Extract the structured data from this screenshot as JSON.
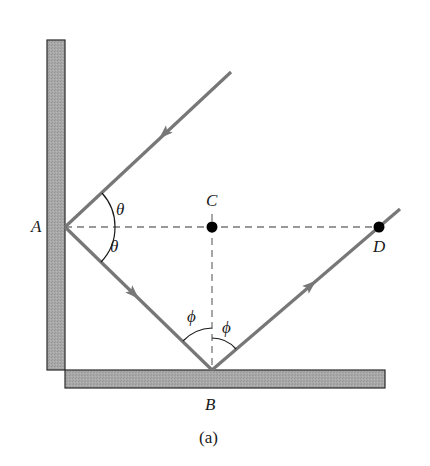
{
  "figure": {
    "caption": "(a)",
    "points": {
      "A": {
        "label": "A"
      },
      "B": {
        "label": "B"
      },
      "C": {
        "label": "C"
      },
      "D": {
        "label": "D"
      }
    },
    "angles": {
      "theta_upper": "θ",
      "theta_lower": "θ",
      "phi_left": "ϕ",
      "phi_right": "ϕ"
    },
    "elements": {
      "vertical_mirror": "vertical wall mirror",
      "horizontal_mirror": "horizontal floor mirror",
      "incident_ray": "ray incoming to A",
      "reflected_ray_1": "ray from A to B",
      "reflected_ray_2": "ray from B through D"
    },
    "colors": {
      "mirror_fill": "#a6a6a6",
      "ray": "#777777",
      "text": "#1a1a1a"
    }
  }
}
